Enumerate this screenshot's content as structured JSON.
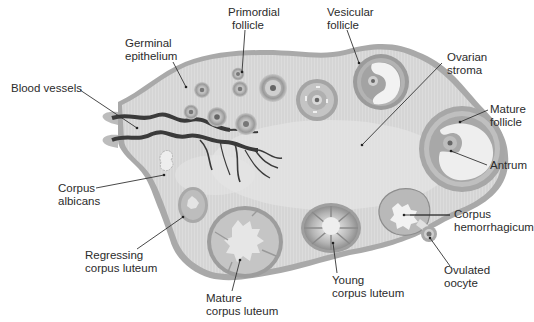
{
  "colors": {
    "background": "#ffffff",
    "stroma": "#d9d9d9",
    "stroma_light": "#e6e6e6",
    "capsule": "#a8a8a8",
    "follicle_ring": "#9c9c9c",
    "follicle_dark": "#7d7d7d",
    "antrum": "#f2f2f2",
    "vessel": "#3a3a3a",
    "text": "#2b2b2b"
  },
  "labels": {
    "primordial_follicle": [
      "Primordial",
      "follicle"
    ],
    "vesicular_follicle": [
      "Vesicular",
      "follicle"
    ],
    "germinal_epithelium": [
      "Germinal",
      "epithelium"
    ],
    "ovarian_stroma": [
      "Ovarian",
      "stroma"
    ],
    "blood_vessels": [
      "Blood vessels"
    ],
    "mature_follicle": [
      "Mature",
      "follicle"
    ],
    "antrum": [
      "Antrum"
    ],
    "corpus_albicans": [
      "Corpus",
      "albicans"
    ],
    "corpus_hemorrhagicum": [
      "Corpus",
      "hemorrhagicum"
    ],
    "regressing_corpus_luteum": [
      "Regressing",
      "corpus luteum"
    ],
    "ovulated_oocyte": [
      "Ovulated",
      "oocyte"
    ],
    "young_corpus_luteum": [
      "Young",
      "corpus luteum"
    ],
    "mature_corpus_luteum": [
      "Mature",
      "corpus luteum"
    ]
  }
}
